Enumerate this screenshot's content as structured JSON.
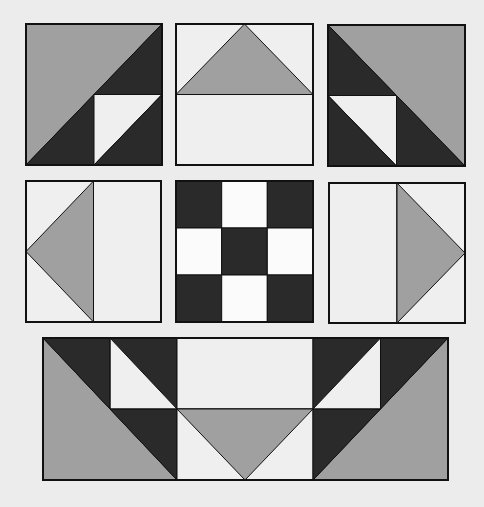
{
  "diagram": {
    "title": "",
    "background": "#ececec",
    "colors": {
      "gray": "#a0a0a0",
      "dark": "#2a2a2a",
      "light": "#efefef",
      "white": "#fbfbfb",
      "outline": "#111111"
    },
    "blocks": [
      {
        "id": "top-left-block",
        "x": 26,
        "y": 24,
        "w": 136,
        "h": 141,
        "patches": [
          {
            "fill": "gray",
            "pts": [
              [
                0,
                0
              ],
              [
                1,
                0
              ],
              [
                0,
                1
              ]
            ]
          },
          {
            "fill": "dark",
            "pts": [
              [
                1,
                0
              ],
              [
                1,
                1
              ],
              [
                0,
                1
              ]
            ]
          },
          {
            "fill": "light",
            "pts": [
              [
                0.5,
                0.5
              ],
              [
                1,
                0.5
              ],
              [
                0.5,
                1
              ]
            ]
          },
          {
            "fill": "dark",
            "pts": [
              [
                1,
                0.5
              ],
              [
                1,
                1
              ],
              [
                0.5,
                1
              ]
            ]
          }
        ]
      },
      {
        "id": "top-center-block",
        "x": 176,
        "y": 24,
        "w": 137,
        "h": 141,
        "patches": [
          {
            "fill": "light",
            "pts": [
              [
                0,
                0
              ],
              [
                1,
                0
              ],
              [
                1,
                0.5
              ],
              [
                0,
                0.5
              ]
            ]
          },
          {
            "fill": "gray",
            "pts": [
              [
                0.5,
                0
              ],
              [
                1,
                0.5
              ],
              [
                0,
                0.5
              ]
            ]
          },
          {
            "fill": "light",
            "pts": [
              [
                0,
                0.5
              ],
              [
                1,
                0.5
              ],
              [
                1,
                1
              ],
              [
                0,
                1
              ]
            ]
          }
        ]
      },
      {
        "id": "top-right-block",
        "x": 328,
        "y": 25,
        "w": 137,
        "h": 141,
        "patches": [
          {
            "fill": "gray",
            "pts": [
              [
                0,
                0
              ],
              [
                1,
                0
              ],
              [
                1,
                1
              ]
            ]
          },
          {
            "fill": "dark",
            "pts": [
              [
                0,
                0
              ],
              [
                1,
                1
              ],
              [
                0,
                1
              ]
            ]
          },
          {
            "fill": "light",
            "pts": [
              [
                0,
                0.5
              ],
              [
                0.5,
                0.5
              ],
              [
                0.5,
                1
              ]
            ]
          },
          {
            "fill": "dark",
            "pts": [
              [
                0,
                0.5
              ],
              [
                0.5,
                1
              ],
              [
                0,
                1
              ]
            ]
          }
        ]
      },
      {
        "id": "middle-left-block",
        "x": 26,
        "y": 181,
        "w": 135,
        "h": 141,
        "patches": [
          {
            "fill": "light",
            "pts": [
              [
                0,
                0
              ],
              [
                0.5,
                0
              ],
              [
                0.5,
                1
              ],
              [
                0,
                1
              ]
            ]
          },
          {
            "fill": "gray",
            "pts": [
              [
                0.5,
                0
              ],
              [
                0.5,
                1
              ],
              [
                0,
                0.5
              ]
            ]
          },
          {
            "fill": "light",
            "pts": [
              [
                0.5,
                0
              ],
              [
                1,
                0
              ],
              [
                1,
                1
              ],
              [
                0.5,
                1
              ]
            ]
          }
        ]
      },
      {
        "id": "center-nine-patch-block",
        "x": 176,
        "y": 181,
        "w": 137,
        "h": 141,
        "patches": [
          {
            "fill": "dark",
            "pts": [
              [
                0,
                0
              ],
              [
                0.3333,
                0
              ],
              [
                0.3333,
                0.3333
              ],
              [
                0,
                0.3333
              ]
            ]
          },
          {
            "fill": "white",
            "pts": [
              [
                0.3333,
                0
              ],
              [
                0.6667,
                0
              ],
              [
                0.6667,
                0.3333
              ],
              [
                0.3333,
                0.3333
              ]
            ]
          },
          {
            "fill": "dark",
            "pts": [
              [
                0.6667,
                0
              ],
              [
                1,
                0
              ],
              [
                1,
                0.3333
              ],
              [
                0.6667,
                0.3333
              ]
            ]
          },
          {
            "fill": "white",
            "pts": [
              [
                0,
                0.3333
              ],
              [
                0.3333,
                0.3333
              ],
              [
                0.3333,
                0.6667
              ],
              [
                0,
                0.6667
              ]
            ]
          },
          {
            "fill": "dark",
            "pts": [
              [
                0.3333,
                0.3333
              ],
              [
                0.6667,
                0.3333
              ],
              [
                0.6667,
                0.6667
              ],
              [
                0.3333,
                0.6667
              ]
            ]
          },
          {
            "fill": "white",
            "pts": [
              [
                0.6667,
                0.3333
              ],
              [
                1,
                0.3333
              ],
              [
                1,
                0.6667
              ],
              [
                0.6667,
                0.6667
              ]
            ]
          },
          {
            "fill": "dark",
            "pts": [
              [
                0,
                0.6667
              ],
              [
                0.3333,
                0.6667
              ],
              [
                0.3333,
                1
              ],
              [
                0,
                1
              ]
            ]
          },
          {
            "fill": "white",
            "pts": [
              [
                0.3333,
                0.6667
              ],
              [
                0.6667,
                0.6667
              ],
              [
                0.6667,
                1
              ],
              [
                0.3333,
                1
              ]
            ]
          },
          {
            "fill": "dark",
            "pts": [
              [
                0.6667,
                0.6667
              ],
              [
                1,
                0.6667
              ],
              [
                1,
                1
              ],
              [
                0.6667,
                1
              ]
            ]
          }
        ]
      },
      {
        "id": "middle-right-block",
        "x": 329,
        "y": 183,
        "w": 136,
        "h": 140,
        "patches": [
          {
            "fill": "light",
            "pts": [
              [
                0,
                0
              ],
              [
                0.5,
                0
              ],
              [
                0.5,
                1
              ],
              [
                0,
                1
              ]
            ]
          },
          {
            "fill": "light",
            "pts": [
              [
                0.5,
                0
              ],
              [
                1,
                0
              ],
              [
                1,
                1
              ],
              [
                0.5,
                1
              ]
            ]
          },
          {
            "fill": "gray",
            "pts": [
              [
                0.5,
                0
              ],
              [
                1,
                0.5
              ],
              [
                0.5,
                1
              ]
            ]
          }
        ]
      },
      {
        "id": "bottom-wide-block",
        "x": 43,
        "y": 338,
        "w": 405,
        "h": 142,
        "patches": [
          {
            "fill": "gray",
            "pts": [
              [
                0,
                0
              ],
              [
                0.3309,
                1
              ],
              [
                0,
                1
              ]
            ]
          },
          {
            "fill": "dark",
            "pts": [
              [
                0,
                0
              ],
              [
                0.3309,
                0
              ],
              [
                0.3309,
                1
              ]
            ]
          },
          {
            "fill": "light",
            "pts": [
              [
                0.1654,
                0
              ],
              [
                0.3309,
                0.5
              ],
              [
                0.1654,
                0.5
              ]
            ]
          },
          {
            "fill": "light",
            "pts": [
              [
                0.3309,
                0
              ],
              [
                0.6667,
                0
              ],
              [
                0.6667,
                0.5
              ],
              [
                0.3309,
                0.5
              ]
            ]
          },
          {
            "fill": "light",
            "pts": [
              [
                0.3309,
                0.5
              ],
              [
                0.6667,
                0.5
              ],
              [
                0.6667,
                1
              ],
              [
                0.3309,
                1
              ]
            ]
          },
          {
            "fill": "gray",
            "pts": [
              [
                0.3309,
                0.5
              ],
              [
                0.6667,
                0.5
              ],
              [
                0.4988,
                1
              ]
            ]
          },
          {
            "fill": "gray",
            "pts": [
              [
                1,
                0
              ],
              [
                1,
                1
              ],
              [
                0.6667,
                1
              ]
            ]
          },
          {
            "fill": "dark",
            "pts": [
              [
                0.6667,
                0
              ],
              [
                1,
                0
              ],
              [
                0.6667,
                1
              ]
            ]
          },
          {
            "fill": "light",
            "pts": [
              [
                0.8333,
                0
              ],
              [
                0.8333,
                0.5
              ],
              [
                0.6667,
                0.5
              ]
            ]
          }
        ],
        "lines": [
          [
            [
              0.1654,
              0.5
            ],
            [
              0.3309,
              0.5
            ]
          ],
          [
            [
              0.1654,
              0
            ],
            [
              0.1654,
              0.5
            ]
          ],
          [
            [
              0.6667,
              0.5
            ],
            [
              0.8333,
              0.5
            ]
          ],
          [
            [
              0.8333,
              0
            ],
            [
              0.8333,
              0.5
            ]
          ]
        ]
      }
    ]
  }
}
